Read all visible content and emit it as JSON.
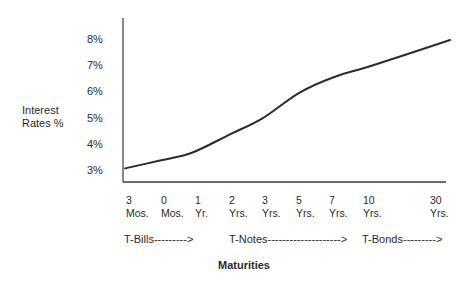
{
  "chart_data": {
    "type": "line",
    "title": "",
    "xlabel": "Maturities",
    "ylabel": "Interest Rates %",
    "categories": [
      "3 Mos.",
      "6 Mos.",
      "1 Yr.",
      "2 Yrs.",
      "3 Yrs.",
      "5 Yrs.",
      "7 Yrs.",
      "10 Yrs.",
      "30 Yrs."
    ],
    "x_tick_labels": [
      {
        "top": "3",
        "bottom": "Mos."
      },
      {
        "top": "0",
        "bottom": "Mos."
      },
      {
        "top": "1",
        "bottom": "Yr."
      },
      {
        "top": "2",
        "bottom": "Yrs."
      },
      {
        "top": "3",
        "bottom": "Yrs."
      },
      {
        "top": "5",
        "bottom": "Yrs."
      },
      {
        "top": "7",
        "bottom": "Yrs."
      },
      {
        "top": "10",
        "bottom": "Yrs."
      },
      {
        "top": "30",
        "bottom": "Yrs."
      }
    ],
    "series": [
      {
        "name": "Yield Curve",
        "values": [
          3.1,
          3.4,
          3.7,
          4.4,
          5.0,
          6.0,
          6.6,
          7.0,
          8.0
        ]
      }
    ],
    "y_ticks": [
      "8%",
      "7%",
      "6%",
      "5%",
      "4%",
      "3%"
    ],
    "ylim": [
      3,
      8
    ],
    "grid": false,
    "legend": "none",
    "annotations": [
      "T-Bills--------->",
      "T-Notes-------------------->",
      "T-Bonds--------->"
    ]
  },
  "axis": {
    "ylabel_line1": "Interest",
    "ylabel_line2": "Rates %",
    "xlabel": "Maturities"
  },
  "ranges": {
    "bills": "T-Bills--------->",
    "notes": "T-Notes-------------------->",
    "bonds": "T-Bonds--------->"
  },
  "colors": {
    "line": "#2b2b2b",
    "axis": "#3a3a3a",
    "text": "#2a2a2a"
  }
}
